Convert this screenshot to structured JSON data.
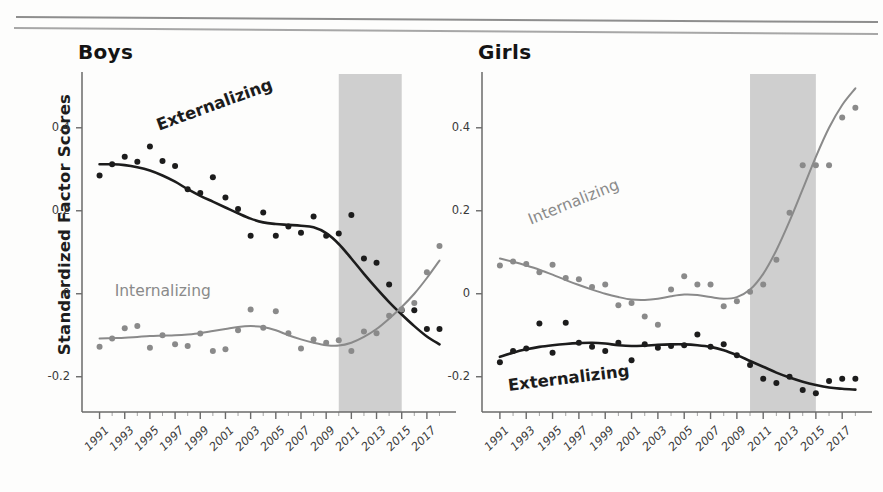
{
  "figure": {
    "y_axis_title": "Standardized Factor Scores",
    "y_ticks": [
      "0.4",
      "0.2",
      "0",
      "-0.2"
    ],
    "y_tick_values": [
      0.4,
      0.2,
      0,
      -0.2
    ],
    "x_ticks": [
      "1991",
      "1993",
      "1995",
      "1997",
      "1999",
      "2001",
      "2003",
      "2005",
      "2007",
      "2009",
      "2011",
      "2013",
      "2015",
      "2017"
    ],
    "colors": {
      "externalizing": "#1c1c1c",
      "internalizing": "#8a8a8a",
      "shaded_band": "#cfcfcf",
      "axis": "#6a6a6a",
      "rule": "#6e6e6e"
    }
  },
  "chart_data": [
    {
      "type": "scatter",
      "title": "Boys",
      "xlabel": "",
      "ylabel": "Standardized Factor Scores",
      "xlim": [
        1990.4,
        2018.2
      ],
      "ylim": [
        -0.285,
        0.52
      ],
      "grid": false,
      "legend": "inline-annotation",
      "shaded_band": {
        "x0": 2010,
        "x1": 2015,
        "color": "#cfcfcf"
      },
      "annotations": [
        {
          "text": "Externalizing",
          "x": 1995.6,
          "y": 0.405,
          "rotation": -20,
          "color": "#1c1c1c"
        },
        {
          "text": "Internalizing",
          "x": 1992.2,
          "y": 0.005,
          "rotation": 0,
          "color": "#8a8a8a"
        }
      ],
      "series": [
        {
          "name": "Externalizing",
          "color": "#1c1c1c",
          "x": [
            1991,
            1992,
            1993,
            1994,
            1995,
            1996,
            1997,
            1998,
            1999,
            2000,
            2001,
            2002,
            2003,
            2004,
            2005,
            2006,
            2007,
            2008,
            2009,
            2010,
            2011,
            2012,
            2013,
            2014,
            2015,
            2016,
            2017,
            2018
          ],
          "points": [
            0.285,
            0.312,
            0.33,
            0.318,
            0.355,
            0.32,
            0.308,
            0.252,
            0.243,
            0.281,
            0.232,
            0.204,
            0.14,
            0.196,
            0.14,
            0.162,
            0.147,
            0.186,
            0.14,
            0.145,
            0.19,
            0.085,
            0.075,
            0.022,
            -0.04,
            -0.04,
            -0.085,
            -0.085
          ],
          "smooth": [
            0.312,
            0.312,
            0.31,
            0.305,
            0.297,
            0.285,
            0.27,
            0.252,
            0.236,
            0.222,
            0.208,
            0.194,
            0.181,
            0.172,
            0.168,
            0.166,
            0.164,
            0.16,
            0.146,
            0.12,
            0.085,
            0.048,
            0.013,
            -0.02,
            -0.05,
            -0.078,
            -0.103,
            -0.122
          ]
        },
        {
          "name": "Internalizing",
          "color": "#8a8a8a",
          "x": [
            1991,
            1992,
            1993,
            1994,
            1995,
            1996,
            1997,
            1998,
            1999,
            2000,
            2001,
            2002,
            2003,
            2004,
            2005,
            2006,
            2007,
            2008,
            2009,
            2010,
            2011,
            2012,
            2013,
            2014,
            2015,
            2016,
            2017,
            2018
          ],
          "points": [
            -0.128,
            -0.108,
            -0.083,
            -0.078,
            -0.13,
            -0.1,
            -0.122,
            -0.126,
            -0.096,
            -0.138,
            -0.134,
            -0.088,
            -0.038,
            -0.082,
            -0.042,
            -0.095,
            -0.132,
            -0.11,
            -0.118,
            -0.112,
            -0.138,
            -0.091,
            -0.095,
            -0.053,
            -0.038,
            -0.022,
            0.052,
            0.115
          ],
          "smooth": [
            -0.108,
            -0.107,
            -0.106,
            -0.104,
            -0.102,
            -0.101,
            -0.1,
            -0.098,
            -0.095,
            -0.09,
            -0.085,
            -0.08,
            -0.078,
            -0.08,
            -0.088,
            -0.1,
            -0.11,
            -0.118,
            -0.124,
            -0.125,
            -0.118,
            -0.104,
            -0.085,
            -0.06,
            -0.032,
            0.0,
            0.038,
            0.08
          ]
        }
      ]
    },
    {
      "type": "scatter",
      "title": "Girls",
      "xlabel": "",
      "ylabel": "Standardized Factor Scores",
      "xlim": [
        1990.4,
        2018.2
      ],
      "ylim": [
        -0.285,
        0.52
      ],
      "grid": false,
      "legend": "inline-annotation",
      "shaded_band": {
        "x0": 2010,
        "x1": 2015,
        "color": "#cfcfcf"
      },
      "annotations": [
        {
          "text": "Internalizing",
          "x": 1993.2,
          "y": 0.175,
          "rotation": -22,
          "color": "#8a8a8a"
        },
        {
          "text": "Externalizing",
          "x": 1991.6,
          "y": -0.222,
          "rotation": -7,
          "color": "#1c1c1c"
        }
      ],
      "series": [
        {
          "name": "Internalizing",
          "color": "#8a8a8a",
          "x": [
            1991,
            1992,
            1993,
            1994,
            1995,
            1996,
            1997,
            1998,
            1999,
            2000,
            2001,
            2002,
            2003,
            2004,
            2005,
            2006,
            2007,
            2008,
            2009,
            2010,
            2011,
            2012,
            2013,
            2014,
            2015,
            2016,
            2017,
            2018
          ],
          "points": [
            0.068,
            0.078,
            0.072,
            0.052,
            0.07,
            0.038,
            0.035,
            0.016,
            0.022,
            -0.028,
            -0.022,
            -0.055,
            -0.075,
            0.01,
            0.042,
            0.022,
            0.022,
            -0.03,
            -0.018,
            0.005,
            0.022,
            0.082,
            0.195,
            0.31,
            0.31,
            0.31,
            0.425,
            0.448
          ],
          "smooth": [
            0.085,
            0.077,
            0.068,
            0.058,
            0.046,
            0.033,
            0.021,
            0.01,
            0.0,
            -0.008,
            -0.014,
            -0.015,
            -0.012,
            -0.006,
            -0.002,
            -0.003,
            -0.008,
            -0.012,
            -0.008,
            0.01,
            0.048,
            0.105,
            0.175,
            0.252,
            0.33,
            0.4,
            0.455,
            0.495
          ]
        },
        {
          "name": "Externalizing",
          "color": "#1c1c1c",
          "x": [
            1991,
            1992,
            1993,
            1994,
            1995,
            1996,
            1997,
            1998,
            1999,
            2000,
            2001,
            2002,
            2003,
            2004,
            2005,
            2006,
            2007,
            2008,
            2009,
            2010,
            2011,
            2012,
            2013,
            2014,
            2015,
            2016,
            2017,
            2018
          ],
          "points": [
            -0.165,
            -0.138,
            -0.132,
            -0.072,
            -0.142,
            -0.07,
            -0.118,
            -0.128,
            -0.138,
            -0.118,
            -0.16,
            -0.122,
            -0.13,
            -0.126,
            -0.124,
            -0.098,
            -0.128,
            -0.122,
            -0.148,
            -0.172,
            -0.205,
            -0.215,
            -0.2,
            -0.232,
            -0.24,
            -0.21,
            -0.205,
            -0.205
          ],
          "smooth": [
            -0.152,
            -0.142,
            -0.134,
            -0.128,
            -0.124,
            -0.121,
            -0.119,
            -0.118,
            -0.12,
            -0.124,
            -0.126,
            -0.125,
            -0.123,
            -0.122,
            -0.122,
            -0.124,
            -0.128,
            -0.136,
            -0.148,
            -0.162,
            -0.176,
            -0.19,
            -0.202,
            -0.212,
            -0.22,
            -0.226,
            -0.229,
            -0.231
          ]
        }
      ]
    }
  ]
}
